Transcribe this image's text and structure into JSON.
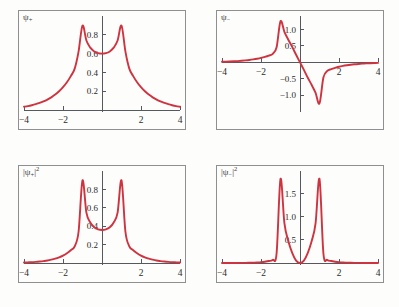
{
  "figure": {
    "background_color": "#fdfdfb",
    "curve_color": "#cf3340",
    "frame_color": "#8d8f91",
    "axis_color": "#55585c",
    "rows": 2,
    "columns": 2
  },
  "panels": [
    {
      "id": "psi-plus",
      "label_text": "ψ",
      "label_sub": "+",
      "label_sup": "",
      "label_bar_left": "",
      "label_bar_right": ""
    },
    {
      "id": "psi-minus",
      "label_text": "ψ",
      "label_sub": "−",
      "label_sup": "",
      "label_bar_left": "",
      "label_bar_right": ""
    },
    {
      "id": "psi-plus-squared",
      "label_text": "ψ",
      "label_sub": "+",
      "label_sup": "2",
      "label_bar_left": "|",
      "label_bar_right": "|"
    },
    {
      "id": "psi-minus-squared",
      "label_text": "ψ",
      "label_sub": "−",
      "label_sup": "2",
      "label_bar_left": "|",
      "label_bar_right": "|"
    }
  ],
  "chart_data": [
    {
      "type": "line",
      "id": "psi-plus",
      "title": "ψ₊",
      "xlabel": "",
      "ylabel": "",
      "xlim": [
        -4,
        4
      ],
      "ylim": [
        0,
        0.98
      ],
      "xticks": [
        -4,
        -2,
        2,
        4
      ],
      "xticklabels": [
        "−4",
        "−2",
        "2",
        "4"
      ],
      "yticks": [
        0.2,
        0.4,
        0.6,
        0.8
      ],
      "yticklabels": [
        "0.2",
        "0.4",
        "0.6",
        "0.8"
      ],
      "grid": false,
      "legend": "none",
      "series": [
        {
          "name": "psi_plus",
          "color": "#cf3340",
          "description": "Symmetric combination of two exponential (delta-well) orbitals centred at x = -1 and x = +1; cusped maxima at the well positions, shallow minimum at x = 0.",
          "x": [
            -4.0,
            -3.8,
            -3.6,
            -3.4,
            -3.2,
            -3.0,
            -2.8,
            -2.6,
            -2.4,
            -2.2,
            -2.0,
            -1.8,
            -1.6,
            -1.4,
            -1.2,
            -1.0,
            -0.8,
            -0.6,
            -0.4,
            -0.2,
            0.0,
            0.2,
            0.4,
            0.6,
            0.8,
            1.0,
            1.2,
            1.4,
            1.6,
            1.8,
            2.0,
            2.2,
            2.4,
            2.6,
            2.8,
            3.0,
            3.2,
            3.4,
            3.6,
            3.8,
            4.0
          ],
          "y": [
            0.035,
            0.042,
            0.051,
            0.062,
            0.075,
            0.091,
            0.111,
            0.135,
            0.164,
            0.2,
            0.243,
            0.296,
            0.361,
            0.441,
            0.624,
            0.9,
            0.74,
            0.664,
            0.624,
            0.605,
            0.6,
            0.605,
            0.624,
            0.664,
            0.74,
            0.9,
            0.624,
            0.441,
            0.361,
            0.296,
            0.243,
            0.2,
            0.164,
            0.135,
            0.111,
            0.091,
            0.075,
            0.062,
            0.051,
            0.042,
            0.035
          ]
        }
      ]
    },
    {
      "type": "line",
      "id": "psi-minus",
      "title": "ψ₋",
      "xlabel": "",
      "ylabel": "",
      "xlim": [
        -4,
        4
      ],
      "ylim": [
        -1.45,
        1.35
      ],
      "xticks": [
        -4,
        -2,
        2,
        4
      ],
      "xticklabels": [
        "−4",
        "−2",
        "2",
        "4"
      ],
      "yticks": [
        -1.0,
        -0.5,
        0.5,
        1.0
      ],
      "yticklabels": [
        "−1.0",
        "−0.5",
        "0.5",
        "1.0"
      ],
      "grid": false,
      "legend": "none",
      "series": [
        {
          "name": "psi_minus",
          "color": "#cf3340",
          "description": "Antisymmetric combination; positive cusped peak at x = -1, node at x = 0, negative cusped trough at x = +1.",
          "x": [
            -4.0,
            -3.8,
            -3.6,
            -3.4,
            -3.2,
            -3.0,
            -2.8,
            -2.6,
            -2.4,
            -2.2,
            -2.0,
            -1.8,
            -1.6,
            -1.4,
            -1.2,
            -1.0,
            -0.8,
            -0.6,
            -0.4,
            -0.2,
            0.0,
            0.2,
            0.4,
            0.6,
            0.8,
            1.0,
            1.2,
            1.4,
            1.6,
            1.8,
            2.0,
            2.2,
            2.4,
            2.6,
            2.8,
            3.0,
            3.2,
            3.4,
            3.6,
            3.8,
            4.0
          ],
          "y": [
            0.017,
            0.021,
            0.026,
            0.032,
            0.039,
            0.048,
            0.059,
            0.072,
            0.089,
            0.109,
            0.134,
            0.166,
            0.206,
            0.259,
            0.46,
            1.25,
            0.93,
            0.69,
            0.47,
            0.23,
            0.0,
            -0.23,
            -0.47,
            -0.69,
            -0.93,
            -1.25,
            -0.46,
            -0.259,
            -0.206,
            -0.166,
            -0.134,
            -0.109,
            -0.089,
            -0.072,
            -0.059,
            -0.048,
            -0.039,
            -0.032,
            -0.026,
            -0.021,
            -0.017
          ]
        }
      ]
    },
    {
      "type": "line",
      "id": "psi-plus-squared",
      "title": "|ψ₊|²",
      "xlabel": "",
      "ylabel": "",
      "xlim": [
        -4,
        4
      ],
      "ylim": [
        0,
        0.98
      ],
      "xticks": [
        -4,
        -2,
        2,
        4
      ],
      "xticklabels": [
        "−4",
        "−2",
        "2",
        "4"
      ],
      "yticks": [
        0.2,
        0.4,
        0.6,
        0.8
      ],
      "yticklabels": [
        "0.2",
        "0.4",
        "0.6",
        "0.8"
      ],
      "grid": false,
      "legend": "none",
      "series": [
        {
          "name": "psi_plus_squared",
          "color": "#cf3340",
          "description": "Probability density of the symmetric state; two sharp maxima near 0.9 at x = ±1 with a non-zero minimum near 0.4 at x = 0 (bonding charge build-up).",
          "x": [
            -4.0,
            -3.8,
            -3.6,
            -3.4,
            -3.2,
            -3.0,
            -2.8,
            -2.6,
            -2.4,
            -2.2,
            -2.0,
            -1.8,
            -1.6,
            -1.4,
            -1.2,
            -1.0,
            -0.8,
            -0.6,
            -0.4,
            -0.2,
            0.0,
            0.2,
            0.4,
            0.6,
            0.8,
            1.0,
            1.2,
            1.4,
            1.6,
            1.8,
            2.0,
            2.2,
            2.4,
            2.6,
            2.8,
            3.0,
            3.2,
            3.4,
            3.6,
            3.8,
            4.0
          ],
          "y": [
            0.005,
            0.007,
            0.009,
            0.012,
            0.016,
            0.021,
            0.027,
            0.036,
            0.047,
            0.062,
            0.081,
            0.106,
            0.139,
            0.182,
            0.343,
            0.9,
            0.548,
            0.441,
            0.389,
            0.366,
            0.36,
            0.366,
            0.389,
            0.441,
            0.548,
            0.9,
            0.343,
            0.182,
            0.139,
            0.106,
            0.081,
            0.062,
            0.047,
            0.036,
            0.027,
            0.021,
            0.016,
            0.012,
            0.009,
            0.007,
            0.005
          ]
        }
      ]
    },
    {
      "type": "line",
      "id": "psi-minus-squared",
      "title": "|ψ₋|²",
      "xlabel": "",
      "ylabel": "",
      "xlim": [
        -4,
        4
      ],
      "ylim": [
        0,
        1.95
      ],
      "xticks": [
        -4,
        -2,
        2,
        4
      ],
      "xticklabels": [
        "−4",
        "−2",
        "2",
        "4"
      ],
      "yticks": [
        0.5,
        1.0,
        1.5
      ],
      "yticklabels": [
        "0.5",
        "1.0",
        "1.5"
      ],
      "grid": false,
      "legend": "none",
      "series": [
        {
          "name": "psi_minus_squared",
          "color": "#cf3340",
          "description": "Probability density of the antisymmetric state; two tall narrow peaks near 1.8 at x = ±1 separated by a node (zero) at x = 0 (antibonding).",
          "x": [
            -4.0,
            -3.8,
            -3.6,
            -3.4,
            -3.2,
            -3.0,
            -2.8,
            -2.6,
            -2.4,
            -2.2,
            -2.0,
            -1.8,
            -1.6,
            -1.4,
            -1.2,
            -1.0,
            -0.8,
            -0.6,
            -0.4,
            -0.2,
            0.0,
            0.2,
            0.4,
            0.6,
            0.8,
            1.0,
            1.2,
            1.4,
            1.6,
            1.8,
            2.0,
            2.2,
            2.4,
            2.6,
            2.8,
            3.0,
            3.2,
            3.4,
            3.6,
            3.8,
            4.0
          ],
          "y": [
            0.0003,
            0.0004,
            0.0007,
            0.001,
            0.0015,
            0.0023,
            0.0035,
            0.0052,
            0.0079,
            0.0119,
            0.018,
            0.0276,
            0.0424,
            0.0671,
            0.212,
            1.82,
            0.865,
            0.476,
            0.221,
            0.053,
            0.0,
            0.053,
            0.221,
            0.476,
            0.865,
            1.82,
            0.212,
            0.0671,
            0.0424,
            0.0276,
            0.018,
            0.0119,
            0.0079,
            0.0052,
            0.0035,
            0.0023,
            0.0015,
            0.001,
            0.0007,
            0.0004,
            0.0003
          ]
        }
      ]
    }
  ]
}
